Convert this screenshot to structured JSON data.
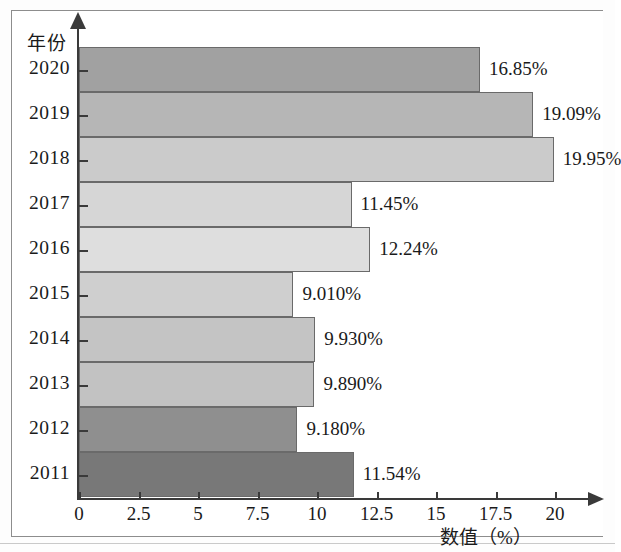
{
  "chart_data": {
    "type": "bar",
    "orientation": "horizontal",
    "title": "",
    "subtitle": "",
    "xlabel": "数值（%）",
    "ylabel": "年份",
    "xlim": [
      0,
      21.5
    ],
    "xticks": [
      "0",
      "2.5",
      "5",
      "7.5",
      "10",
      "12.5",
      "15",
      "17.5",
      "20"
    ],
    "xtick_values": [
      0,
      2.5,
      5,
      7.5,
      10,
      12.5,
      15,
      17.5,
      20
    ],
    "grid": false,
    "legend": "none",
    "categories": [
      "2011",
      "2012",
      "2013",
      "2014",
      "2015",
      "2016",
      "2017",
      "2018",
      "2019",
      "2020"
    ],
    "values": [
      11.54,
      9.18,
      9.89,
      9.93,
      9.01,
      12.24,
      11.45,
      19.95,
      19.09,
      16.85
    ],
    "data_labels": [
      "11.54%",
      "9.180%",
      "9.890%",
      "9.930%",
      "9.010%",
      "12.24%",
      "11.45%",
      "19.95%",
      "19.09%",
      "16.85%"
    ],
    "bar_colors": [
      "#787878",
      "#8f8f8f",
      "#c2c2c2",
      "#c4c4c4",
      "#cfcfcf",
      "#dedede",
      "#d6d6d6",
      "#cbcbcb",
      "#b6b6b6",
      "#a1a1a1"
    ],
    "bars": [
      {
        "year": "2011",
        "value": 11.54,
        "label": "11.54%",
        "color": "#787878"
      },
      {
        "year": "2012",
        "value": 9.18,
        "label": "9.180%",
        "color": "#8f8f8f"
      },
      {
        "year": "2013",
        "value": 9.89,
        "label": "9.890%",
        "color": "#c2c2c2"
      },
      {
        "year": "2014",
        "value": 9.93,
        "label": "9.930%",
        "color": "#c4c4c4"
      },
      {
        "year": "2015",
        "value": 9.01,
        "label": "9.010%",
        "color": "#cfcfcf"
      },
      {
        "year": "2016",
        "value": 12.24,
        "label": "12.24%",
        "color": "#dedede"
      },
      {
        "year": "2017",
        "value": 11.45,
        "label": "11.45%",
        "color": "#d6d6d6"
      },
      {
        "year": "2018",
        "value": 19.95,
        "label": "19.95%",
        "color": "#cbcbcb"
      },
      {
        "year": "2019",
        "value": 19.09,
        "label": "19.09%",
        "color": "#b6b6b6"
      },
      {
        "year": "2020",
        "value": 16.85,
        "label": "16.85%",
        "color": "#a1a1a1"
      }
    ]
  },
  "axis": {
    "y_title": "年份",
    "x_title": "数值（%）"
  },
  "colors": {
    "axis": "#3a3a3a",
    "bar_outline": "#6a6a6a",
    "frame": "#8d8d8d",
    "text": "#1a1a1a",
    "page_background": "#ffffff"
  }
}
